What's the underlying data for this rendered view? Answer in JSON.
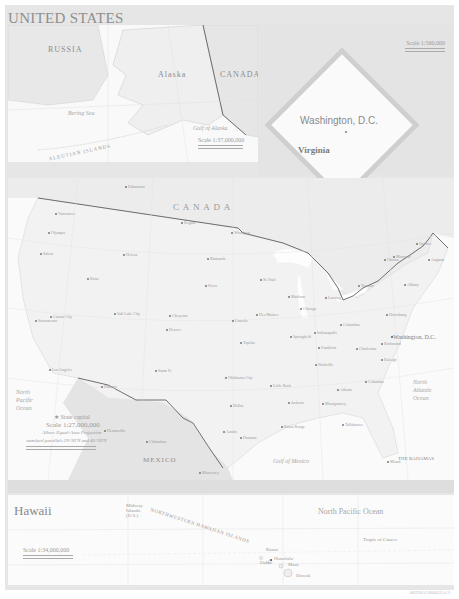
{
  "title": "UNITED STATES",
  "alaska_inset": {
    "labels": {
      "russia": "RUSSIA",
      "alaska": "Alaska",
      "canada": "CANADA",
      "bering_sea": "Bering Sea",
      "aleutian": "ALEUTIAN ISLANDS",
      "gulf_alaska": "Gulf of Alaska"
    },
    "cities": [
      "Anadyr'",
      "Provideniya",
      "Nome",
      "Fairbanks",
      "Anchorage",
      "Juneau",
      "Bethel",
      "Prudhoe Bay",
      "Whitehorse"
    ],
    "scale": "Scale 1:37,000,000",
    "scale_km": "400 Kilometers",
    "scale_mi": "400 Miles"
  },
  "dc_inset": {
    "title": "Washington, D.C.",
    "state": "Virginia",
    "scale": "Scale 1:560,000",
    "scale_km": "5 Kilometers",
    "scale_mi": "5 Miles",
    "places": [
      "White House",
      "U.S. Capitol",
      "Pentagon",
      "Alexandria"
    ]
  },
  "main_map": {
    "canada": "C A N A D A",
    "mexico": "MEXICO",
    "bahamas": "THE BAHAMAS",
    "nassau": "Nassau",
    "gulf_mexico": "Gulf of Mexico",
    "north_pacific": [
      "North",
      "Pacific",
      "Ocean"
    ],
    "north_atlantic": [
      "North",
      "Atlantic",
      "Ocean"
    ],
    "washington_dc": "Washington, D.C.",
    "legend_capital": "State capital",
    "scale": "Scale 1:27,000,000",
    "projection": "Albers Equal-Area Projection",
    "parallels": "standard parallels 29°30'N and 45°30'N",
    "scale_km": "500 Kilometers",
    "scale_mi": "500 Miles",
    "cities": [
      {
        "name": "Olympia",
        "x": 48,
        "y": 232
      },
      {
        "name": "Salem",
        "x": 40,
        "y": 253
      },
      {
        "name": "Boise",
        "x": 87,
        "y": 278
      },
      {
        "name": "Helena",
        "x": 123,
        "y": 254
      },
      {
        "name": "Bismarck",
        "x": 207,
        "y": 258
      },
      {
        "name": "Pierre",
        "x": 205,
        "y": 285
      },
      {
        "name": "Cheyenne",
        "x": 169,
        "y": 315
      },
      {
        "name": "Denver",
        "x": 166,
        "y": 329
      },
      {
        "name": "Salt Lake City",
        "x": 114,
        "y": 313
      },
      {
        "name": "Sacramento",
        "x": 35,
        "y": 320
      },
      {
        "name": "Carson City",
        "x": 50,
        "y": 316
      },
      {
        "name": "Los Angeles",
        "x": 49,
        "y": 369
      },
      {
        "name": "Phoenix",
        "x": 101,
        "y": 386
      },
      {
        "name": "Santa Fe",
        "x": 155,
        "y": 370
      },
      {
        "name": "Oklahoma City",
        "x": 225,
        "y": 377
      },
      {
        "name": "Austin",
        "x": 223,
        "y": 431
      },
      {
        "name": "Topeka",
        "x": 240,
        "y": 342
      },
      {
        "name": "Lincoln",
        "x": 232,
        "y": 320
      },
      {
        "name": "Des Moines",
        "x": 256,
        "y": 314
      },
      {
        "name": "St. Paul",
        "x": 260,
        "y": 279
      },
      {
        "name": "Madison",
        "x": 288,
        "y": 296
      },
      {
        "name": "Springfield",
        "x": 290,
        "y": 336
      },
      {
        "name": "Indianapolis",
        "x": 314,
        "y": 332
      },
      {
        "name": "Columbus",
        "x": 340,
        "y": 324
      },
      {
        "name": "Lansing",
        "x": 325,
        "y": 297
      },
      {
        "name": "Frankfort",
        "x": 318,
        "y": 347
      },
      {
        "name": "Nashville",
        "x": 315,
        "y": 364
      },
      {
        "name": "Little Rock",
        "x": 270,
        "y": 385
      },
      {
        "name": "Jackson",
        "x": 288,
        "y": 402
      },
      {
        "name": "Baton Rouge",
        "x": 281,
        "y": 426
      },
      {
        "name": "Montgomery",
        "x": 322,
        "y": 403
      },
      {
        "name": "Atlanta",
        "x": 337,
        "y": 389
      },
      {
        "name": "Tallahassee",
        "x": 342,
        "y": 424
      },
      {
        "name": "Columbia",
        "x": 365,
        "y": 381
      },
      {
        "name": "Raleigh",
        "x": 381,
        "y": 359
      },
      {
        "name": "Richmond",
        "x": 381,
        "y": 343
      },
      {
        "name": "Charleston",
        "x": 356,
        "y": 348
      },
      {
        "name": "Harrisburg",
        "x": 386,
        "y": 314
      },
      {
        "name": "Albany",
        "x": 404,
        "y": 284
      },
      {
        "name": "Augusta",
        "x": 428,
        "y": 259
      },
      {
        "name": "Ottawa",
        "x": 384,
        "y": 259
      },
      {
        "name": "Montreal",
        "x": 393,
        "y": 256
      },
      {
        "name": "Quebec",
        "x": 416,
        "y": 243
      },
      {
        "name": "Winnipeg",
        "x": 231,
        "y": 232
      },
      {
        "name": "Regina",
        "x": 181,
        "y": 222
      },
      {
        "name": "Edmonton",
        "x": 125,
        "y": 186
      },
      {
        "name": "Vancouver",
        "x": 55,
        "y": 213
      },
      {
        "name": "Toronto",
        "x": 358,
        "y": 285
      },
      {
        "name": "Chicago",
        "x": 300,
        "y": 308
      },
      {
        "name": "Houston",
        "x": 240,
        "y": 437
      },
      {
        "name": "Dallas",
        "x": 230,
        "y": 405
      },
      {
        "name": "Miami",
        "x": 387,
        "y": 461
      },
      {
        "name": "Chihuahua",
        "x": 146,
        "y": 441
      },
      {
        "name": "Monterrey",
        "x": 199,
        "y": 472
      },
      {
        "name": "Hermosillo",
        "x": 104,
        "y": 430
      }
    ]
  },
  "hawaii_inset": {
    "title": "Hawaii",
    "ocean": "North Pacific Ocean",
    "nw_islands": "NORTHWESTERN HAWAIIAN ISLANDS",
    "midway": "Midway Islands (U.S.)",
    "places": [
      "Kauai",
      "Oahu",
      "Honolulu",
      "Maui",
      "Hawaii"
    ],
    "tropic": "Tropic of Cancer",
    "scale": "Scale 1:34,000,000",
    "scale_km": "300 Kilometers",
    "scale_mi": "300 Miles",
    "code": "802958AI (R00452) 4-11"
  },
  "colors": {
    "background": "#e6e6e6",
    "land": "#f0f0f0",
    "water": "#fafafa",
    "border": "#707070",
    "foreign": "#e2e2e2"
  }
}
